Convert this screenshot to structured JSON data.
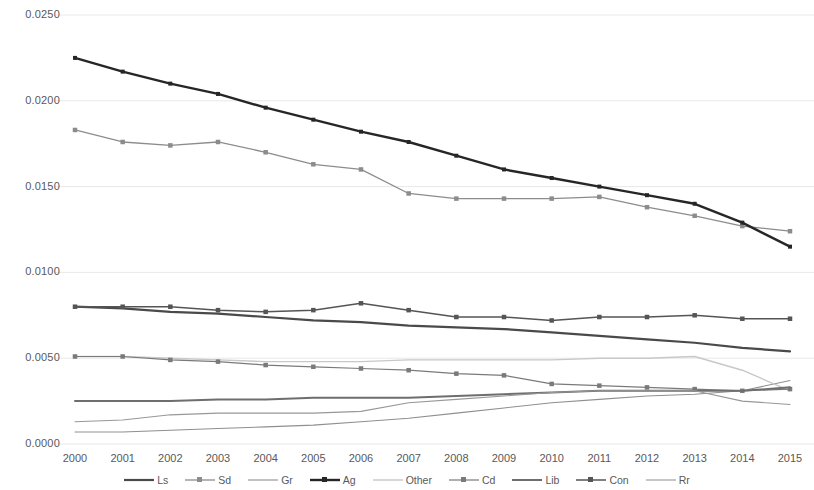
{
  "chart_data": {
    "type": "line",
    "title": "",
    "xlabel": "",
    "ylabel": "",
    "grid": true,
    "legend_position": "bottom",
    "x": [
      2000,
      2001,
      2002,
      2003,
      2004,
      2005,
      2006,
      2007,
      2008,
      2009,
      2010,
      2011,
      2012,
      2013,
      2014,
      2015
    ],
    "categories": [
      "2000",
      "2001",
      "2002",
      "2003",
      "2004",
      "2005",
      "2006",
      "2007",
      "2008",
      "2009",
      "2010",
      "2011",
      "2012",
      "2013",
      "2014",
      "2015"
    ],
    "xlim": [
      2000,
      2015
    ],
    "ylim": [
      0.0,
      0.025
    ],
    "y_ticks": [
      0.0,
      0.005,
      0.01,
      0.015,
      0.02,
      0.025
    ],
    "y_tick_labels": [
      "0.0000",
      "0.0050",
      "0.0100",
      "0.0150",
      "0.0200",
      "0.0250"
    ],
    "series": [
      {
        "name": "Ls",
        "color": "#4a4a4a",
        "width": 2.2,
        "markers": false,
        "values": [
          0.008,
          0.0079,
          0.0077,
          0.0076,
          0.0074,
          0.0072,
          0.0071,
          0.0069,
          0.0068,
          0.0067,
          0.0065,
          0.0063,
          0.0061,
          0.0059,
          0.0056,
          0.0054
        ]
      },
      {
        "name": "Sd",
        "color": "#8c8c8c",
        "width": 1.3,
        "markers": true,
        "values": [
          0.0183,
          0.0176,
          0.0174,
          0.0176,
          0.017,
          0.0163,
          0.016,
          0.0146,
          0.0143,
          0.0143,
          0.0143,
          0.0144,
          0.0138,
          0.0133,
          0.0127,
          0.0124
        ]
      },
      {
        "name": "Gr",
        "color": "#8f8f8f",
        "width": 1.1,
        "markers": false,
        "values": [
          0.0007,
          0.0007,
          0.0008,
          0.0009,
          0.001,
          0.0011,
          0.0013,
          0.0015,
          0.0018,
          0.0021,
          0.0024,
          0.0026,
          0.0028,
          0.0029,
          0.0031,
          0.0037
        ]
      },
      {
        "name": "Ag",
        "color": "#262626",
        "width": 2.4,
        "markers": true,
        "values": [
          0.0225,
          0.0217,
          0.021,
          0.0204,
          0.0196,
          0.0189,
          0.0182,
          0.0176,
          0.0168,
          0.016,
          0.0155,
          0.015,
          0.0145,
          0.014,
          0.0129,
          0.0115
        ]
      },
      {
        "name": "Other",
        "color": "#c8c8c8",
        "width": 1.4,
        "markers": false,
        "values": [
          0.0051,
          0.0051,
          0.005,
          0.0049,
          0.0048,
          0.0048,
          0.0048,
          0.0049,
          0.0049,
          0.0049,
          0.0049,
          0.005,
          0.005,
          0.0051,
          0.0043,
          0.0031
        ]
      },
      {
        "name": "Cd",
        "color": "#7a7a7a",
        "width": 1.2,
        "markers": true,
        "values": [
          0.0051,
          0.0051,
          0.0049,
          0.0048,
          0.0046,
          0.0045,
          0.0044,
          0.0043,
          0.0041,
          0.004,
          0.0035,
          0.0034,
          0.0033,
          0.0032,
          0.0031,
          0.0032
        ]
      },
      {
        "name": "Lib",
        "color": "#6e6e6e",
        "width": 2.0,
        "markers": false,
        "values": [
          0.0025,
          0.0025,
          0.0025,
          0.0026,
          0.0026,
          0.0027,
          0.0027,
          0.0027,
          0.0028,
          0.0029,
          0.003,
          0.0031,
          0.0031,
          0.0031,
          0.0031,
          0.0033
        ]
      },
      {
        "name": "Con",
        "color": "#555555",
        "width": 1.5,
        "markers": true,
        "values": [
          0.008,
          0.008,
          0.008,
          0.0078,
          0.0077,
          0.0078,
          0.0082,
          0.0078,
          0.0074,
          0.0074,
          0.0072,
          0.0074,
          0.0074,
          0.0075,
          0.0073,
          0.0073
        ]
      },
      {
        "name": "Rr",
        "color": "#989898",
        "width": 1.1,
        "markers": false,
        "values": [
          0.0013,
          0.0014,
          0.0017,
          0.0018,
          0.0018,
          0.0018,
          0.0019,
          0.0024,
          0.0026,
          0.0028,
          0.003,
          0.0031,
          0.0031,
          0.0031,
          0.0025,
          0.0023
        ]
      }
    ]
  },
  "axes": {
    "y_tick_labels": [
      "0.0250",
      "0.0200",
      "0.0150",
      "0.0100",
      "0.0050",
      "0.0000"
    ],
    "x_tick_labels": [
      "2000",
      "2001",
      "2002",
      "2003",
      "2004",
      "2005",
      "2006",
      "2007",
      "2008",
      "2009",
      "2010",
      "2011",
      "2012",
      "2013",
      "2014",
      "2015"
    ]
  },
  "legend": {
    "items": [
      {
        "label": "Ls",
        "color": "#4a4a4a",
        "width": 2.2,
        "marker": false
      },
      {
        "label": "Sd",
        "color": "#8c8c8c",
        "width": 1.3,
        "marker": true
      },
      {
        "label": "Gr",
        "color": "#8f8f8f",
        "width": 1.1,
        "marker": false
      },
      {
        "label": "Ag",
        "color": "#262626",
        "width": 2.4,
        "marker": true
      },
      {
        "label": "Other",
        "color": "#c8c8c8",
        "width": 1.4,
        "marker": false
      },
      {
        "label": "Cd",
        "color": "#7a7a7a",
        "width": 1.2,
        "marker": true
      },
      {
        "label": "Lib",
        "color": "#6e6e6e",
        "width": 2.0,
        "marker": false
      },
      {
        "label": "Con",
        "color": "#555555",
        "width": 1.5,
        "marker": true
      },
      {
        "label": "Rr",
        "color": "#989898",
        "width": 1.1,
        "marker": false
      }
    ]
  },
  "style": {
    "background": "#ffffff",
    "gridline_color": "#e8e8e8",
    "text_color": "#595959"
  }
}
